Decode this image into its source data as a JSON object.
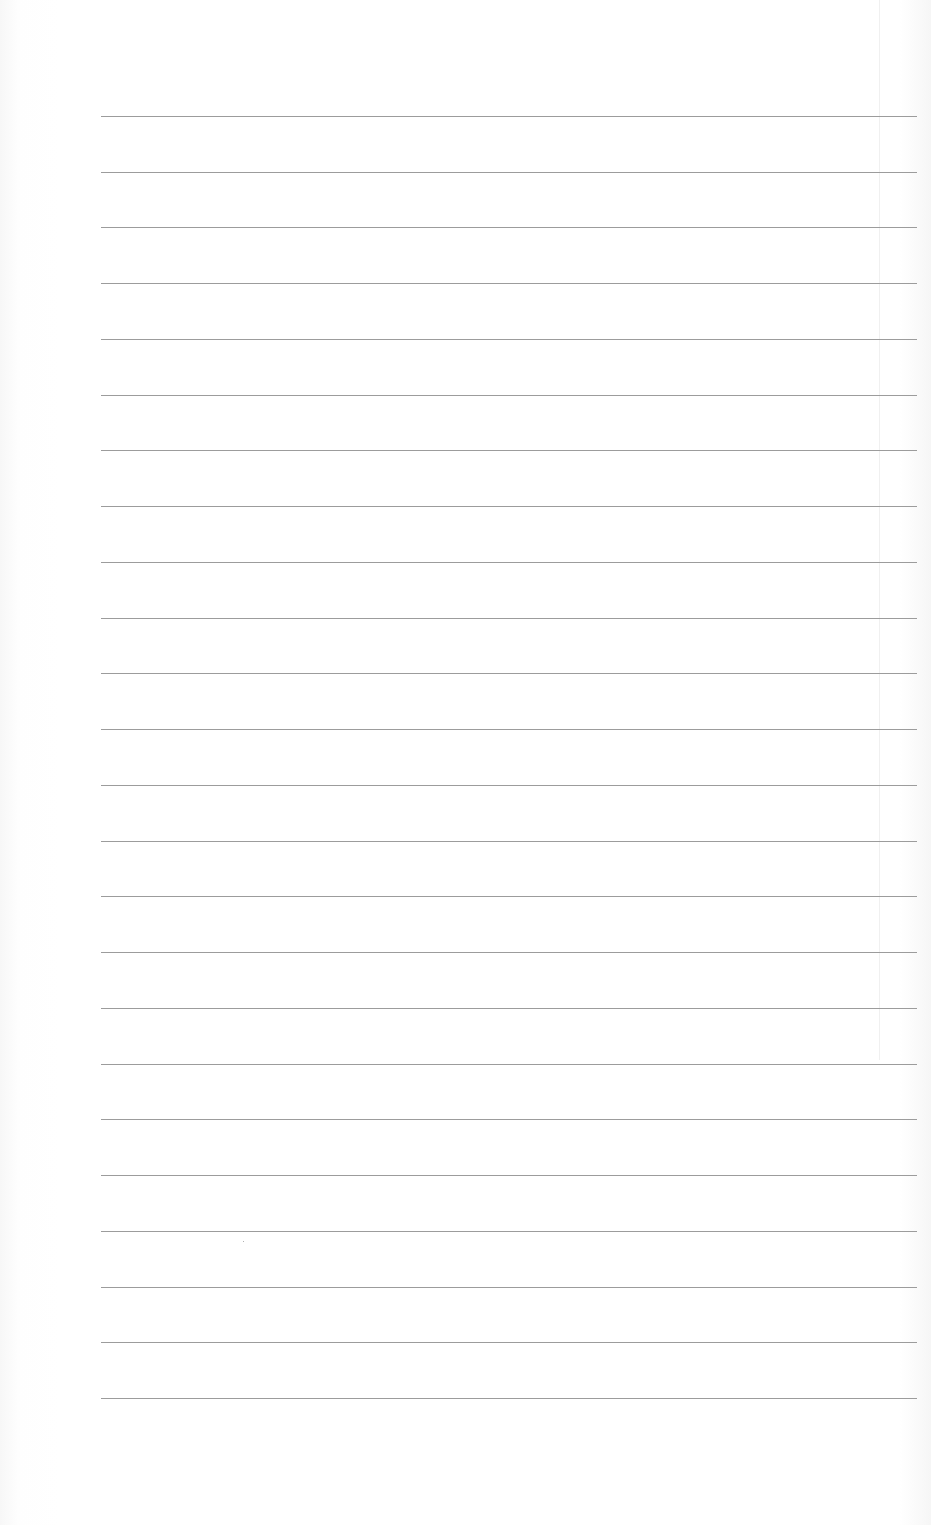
{
  "document": {
    "type": "lined-paper",
    "text": "",
    "rules": {
      "count": 24,
      "first_y": 116,
      "spacing": 55.74,
      "left_x": 101,
      "right_x": 917,
      "color": "#9c9c9c"
    },
    "margin_line": {
      "x": 879,
      "color": "#f0f0f0"
    },
    "marks": [
      {
        "x": 243,
        "y": 1241
      }
    ]
  }
}
